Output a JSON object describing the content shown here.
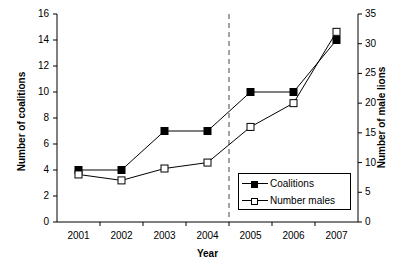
{
  "chart_data": {
    "type": "line",
    "title": "",
    "xlabel": "Year",
    "ylabel": "Number of coalitions",
    "ylabel_right": "Number of male lions",
    "categories": [
      "2001",
      "2002",
      "2003",
      "2004",
      "2005",
      "2006",
      "2007"
    ],
    "series": [
      {
        "name": "Coalitions",
        "axis": "left",
        "marker": "filled-square",
        "values": [
          4,
          4,
          7,
          7,
          10,
          10,
          14
        ]
      },
      {
        "name": "Number males",
        "axis": "right",
        "marker": "open-square",
        "values": [
          8,
          7,
          9,
          10,
          16,
          20,
          32
        ]
      }
    ],
    "ylim": [
      0,
      16
    ],
    "yticks": [
      "0",
      "2",
      "4",
      "6",
      "8",
      "10",
      "12",
      "14",
      "16"
    ],
    "ylim_right": [
      0,
      35
    ],
    "yticks_right": [
      "0",
      "5",
      "10",
      "15",
      "20",
      "25",
      "30",
      "35"
    ],
    "grid": false,
    "legend_position": "lower-right",
    "annotations": [
      {
        "type": "vertical-dashed-line",
        "position_between": [
          "2004",
          "2005"
        ]
      }
    ],
    "colors": {
      "axis": "#000000",
      "series_coalitions": "#000000",
      "series_number_males": "#000000",
      "background": "#ffffff"
    }
  },
  "legend": {
    "items": [
      {
        "label": "Coalitions",
        "marker": "filled-square-marker"
      },
      {
        "label": "Number males",
        "marker": "open-square-marker"
      }
    ]
  },
  "axes": {
    "x_title": "Year",
    "y_left_title": "Number of coalitions",
    "y_right_title": "Number of male lions"
  }
}
